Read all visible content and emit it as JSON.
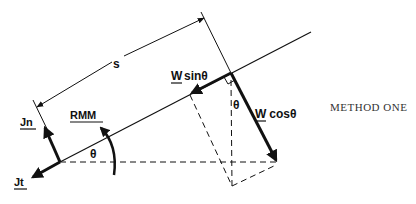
{
  "diagram": {
    "caption": "METHOD ONE",
    "labels": {
      "distance": "s",
      "w_sin_w": "W",
      "w_sin_rest": "sinθ",
      "w_cos_w": "W",
      "w_cos_rest": " cosθ",
      "theta_corner": "θ",
      "theta_origin": "θ",
      "rmm": "RMM",
      "jn": "Jn",
      "jt": "Jt"
    },
    "colors": {
      "ink": "#111111",
      "background": "#ffffff"
    }
  }
}
